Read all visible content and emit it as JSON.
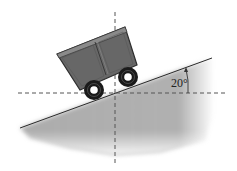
{
  "diagram": {
    "type": "physics-incline",
    "incline_angle_label": "20°",
    "elements": [
      "mine-cart",
      "inclined-plane",
      "vertical-axis",
      "horizontal-axis",
      "angle-arc"
    ],
    "colors": {
      "ground": "#a8a8a8",
      "ground_edge": "#2a2a2a",
      "cart_body": "#666666",
      "cart_outline": "#2e2e2e",
      "wheel": "#1a1a1a",
      "wheel_hub": "#ffffff",
      "axis_dash": "#555555"
    }
  }
}
